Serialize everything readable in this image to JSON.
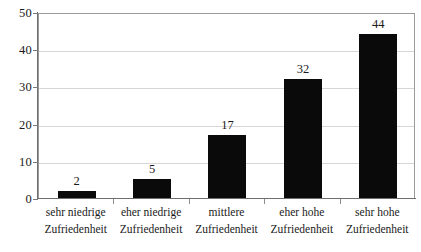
{
  "chart_data": {
    "type": "bar",
    "title": "",
    "subtitle": "",
    "xlabel": "",
    "ylabel": "",
    "categories": [
      "sehr niedrige Zufriedenheit",
      "eher niedrige Zufriedenheit",
      "mittlere Zufriedenheit",
      "eher hohe Zufriedenheit",
      "sehr hohe Zufriedenheit"
    ],
    "category_lines": [
      [
        "sehr niedrige",
        "Zufriedenheit"
      ],
      [
        "eher niedrige",
        "Zufriedenheit"
      ],
      [
        "mittlere",
        "Zufriedenheit"
      ],
      [
        "eher hohe",
        "Zufriedenheit"
      ],
      [
        "sehr hohe",
        "Zufriedenheit"
      ]
    ],
    "values": [
      2,
      5,
      17,
      32,
      44
    ],
    "value_labels": [
      "2",
      "5",
      "17",
      "32",
      "44"
    ],
    "ylim": [
      0,
      50
    ],
    "yticks": [
      0,
      10,
      20,
      30,
      40,
      50
    ],
    "ytick_labels": [
      "0",
      "10",
      "20",
      "30",
      "40",
      "50"
    ],
    "grid": true,
    "legend": false,
    "legend_position": "none",
    "bar_color": "#0a0a0a",
    "gridline_color": "#d6d6d6",
    "axis_color": "#6e6e6e",
    "plot_border_color": "#9a9a9a",
    "background_color": "#ffffff"
  }
}
